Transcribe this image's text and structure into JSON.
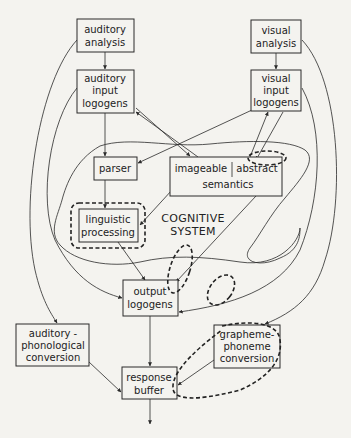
{
  "diagram": {
    "nodes": {
      "auditory_analysis": [
        "auditory",
        "analysis"
      ],
      "visual_analysis": [
        "visual",
        "analysis"
      ],
      "auditory_input_logogens": [
        "auditory",
        "input",
        "logogens"
      ],
      "visual_input_logogens": [
        "visual",
        "input",
        "logogens"
      ],
      "parser": "parser",
      "semantics": {
        "imageable": "imageable",
        "abstract": "abstract",
        "label": "semantics"
      },
      "linguistic_processing": [
        "linguistic",
        "processing"
      ],
      "cognitive_system": [
        "COGNITIVE",
        "SYSTEM"
      ],
      "output_logogens": [
        "output",
        "logogens"
      ],
      "auditory_phonological_conversion": [
        "auditory -",
        "phonological",
        "conversion"
      ],
      "grapheme_phoneme_conversion": [
        "grapheme-",
        "phoneme",
        "conversion"
      ],
      "response_buffer": [
        "response",
        "buffer"
      ]
    }
  }
}
